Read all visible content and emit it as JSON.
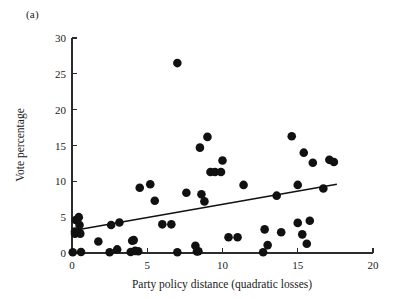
{
  "figure": {
    "panel_label": "(a)",
    "background_color": "#ffffff",
    "ink_color": "#111111"
  },
  "chart_data": {
    "type": "scatter",
    "title": "",
    "subtitle": "",
    "panel_label": "(a)",
    "xlabel": "Party policy distance (quadratic losses)",
    "ylabel": "Vote percentage",
    "xlim": [
      0,
      20
    ],
    "ylim": [
      0,
      30
    ],
    "xticks": [
      0,
      5,
      10,
      15,
      20
    ],
    "yticks": [
      0,
      5,
      10,
      15,
      20,
      25,
      30
    ],
    "xtick_labels": [
      "0",
      "5",
      "10",
      "15",
      "20"
    ],
    "ytick_labels": [
      "0",
      "5",
      "10",
      "15",
      "20",
      "25",
      "30"
    ],
    "grid": false,
    "legend": null,
    "legend_position": "none",
    "marker": "filled-circle",
    "marker_color": "#111111",
    "marker_size_px": 4.3,
    "points": [
      [
        0.05,
        0.1
      ],
      [
        0.2,
        2.7
      ],
      [
        0.2,
        3.0
      ],
      [
        0.25,
        4.6
      ],
      [
        0.45,
        5.0
      ],
      [
        0.5,
        3.9
      ],
      [
        0.5,
        2.8
      ],
      [
        0.55,
        2.7
      ],
      [
        0.6,
        0.15
      ],
      [
        1.75,
        1.6
      ],
      [
        2.5,
        0.1
      ],
      [
        2.6,
        3.9
      ],
      [
        3.0,
        0.5
      ],
      [
        3.15,
        4.25
      ],
      [
        3.9,
        0.15
      ],
      [
        4.0,
        1.7
      ],
      [
        4.1,
        1.8
      ],
      [
        4.2,
        0.3
      ],
      [
        4.4,
        0.25
      ],
      [
        4.5,
        9.1
      ],
      [
        5.2,
        9.6
      ],
      [
        5.5,
        7.3
      ],
      [
        6.0,
        4.0
      ],
      [
        6.6,
        4.0
      ],
      [
        7.0,
        26.5
      ],
      [
        7.0,
        0.1
      ],
      [
        7.6,
        8.4
      ],
      [
        8.2,
        1.0
      ],
      [
        8.3,
        0.2
      ],
      [
        8.4,
        0.25
      ],
      [
        8.5,
        14.7
      ],
      [
        8.6,
        8.2
      ],
      [
        8.8,
        7.2
      ],
      [
        9.0,
        16.2
      ],
      [
        9.2,
        11.3
      ],
      [
        9.5,
        11.3
      ],
      [
        9.9,
        11.3
      ],
      [
        10.0,
        12.9
      ],
      [
        10.4,
        2.2
      ],
      [
        11.0,
        2.2
      ],
      [
        11.4,
        9.5
      ],
      [
        12.7,
        0.1
      ],
      [
        12.8,
        3.3
      ],
      [
        13.0,
        1.1
      ],
      [
        13.6,
        8.0
      ],
      [
        13.9,
        2.9
      ],
      [
        14.6,
        16.3
      ],
      [
        15.0,
        9.5
      ],
      [
        15.0,
        4.2
      ],
      [
        15.3,
        2.6
      ],
      [
        15.4,
        14.0
      ],
      [
        15.6,
        1.3
      ],
      [
        15.8,
        4.5
      ],
      [
        16.0,
        12.6
      ],
      [
        16.7,
        9.0
      ],
      [
        17.1,
        13.0
      ],
      [
        17.4,
        12.7
      ]
    ],
    "fit_line": {
      "type": "linear-regression",
      "x_start": 0.0,
      "y_start": 3.1,
      "x_end": 17.6,
      "y_end": 9.6
    }
  }
}
